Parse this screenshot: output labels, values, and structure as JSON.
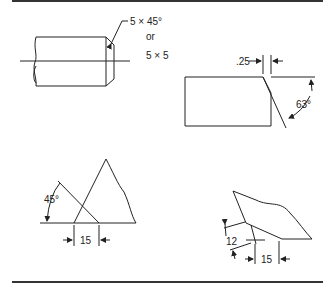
{
  "figure": {
    "top_shaft": {
      "callout_line1": "5 × 45°",
      "callout_line2": "or",
      "callout_line3": "5 × 5"
    },
    "top_block": {
      "dim_offset": ".25",
      "dim_angle": "63°"
    },
    "bottom_left": {
      "dim_angle": "45°",
      "dim_length": "15"
    },
    "bottom_right": {
      "dim_vertical": "12",
      "dim_length": "15"
    }
  }
}
